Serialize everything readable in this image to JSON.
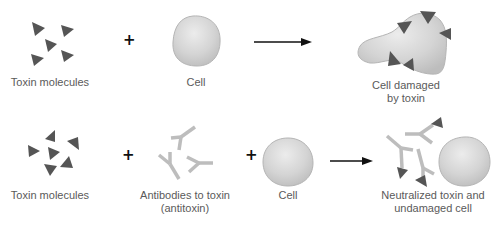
{
  "colors": {
    "toxin": "#555555",
    "cell_fill": "#d6d6d6",
    "cell_stroke": "#b5b5b5",
    "antibody": "#bdbdbd",
    "arrow": "#111111",
    "label": "#5a5a5a"
  },
  "row1": {
    "toxin_label": "Toxin molecules",
    "plus": "+",
    "cell_label": "Cell",
    "result_label_line1": "Cell damaged",
    "result_label_line2": "by toxin"
  },
  "row2": {
    "toxin_label": "Toxin molecules",
    "plus1": "+",
    "antibody_label_line1": "Antibodies to toxin",
    "antibody_label_line2": "(antitoxin)",
    "plus2": "+",
    "cell_label": "Cell",
    "result_label_line1": "Neutralized toxin and",
    "result_label_line2": "undamaged cell"
  }
}
